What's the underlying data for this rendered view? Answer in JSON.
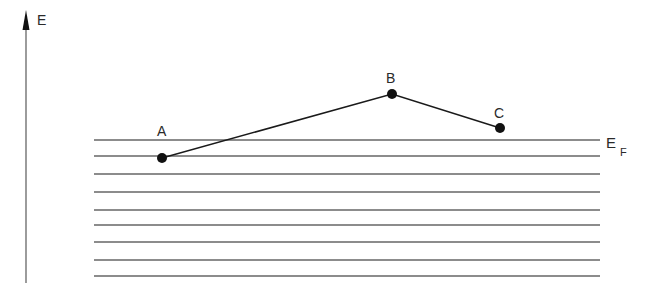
{
  "diagram": {
    "axis": {
      "label": "E",
      "x": 26,
      "y_top": 10,
      "y_bottom": 283
    },
    "fermi_label": {
      "main": "E",
      "sub": "F"
    },
    "levels_y": [
      140,
      156,
      174,
      192,
      210,
      225,
      242,
      260,
      276
    ],
    "levels_x": [
      94,
      600
    ],
    "points": [
      {
        "label": "A",
        "x": 162,
        "y": 158
      },
      {
        "label": "B",
        "x": 392,
        "y": 94
      },
      {
        "label": "C",
        "x": 500,
        "y": 128
      }
    ],
    "colors": {
      "line": "#555555",
      "ink": "#1a1a1a"
    }
  }
}
